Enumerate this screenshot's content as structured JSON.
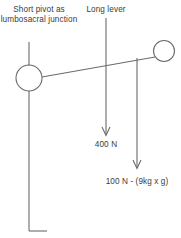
{
  "diagram": {
    "title_labels": {
      "pivot": "Short pivot as lumbosacral junction",
      "lever": "Long lever"
    },
    "forces": [
      {
        "name": "force-a",
        "label": "400 N",
        "value": 400,
        "unit": "N"
      },
      {
        "name": "force-b",
        "label": "100 N - (9kg x g)",
        "value": 100,
        "unit": "N"
      }
    ],
    "colors": {
      "stroke": "#6b6b6b",
      "text": "#3c3c3c",
      "background": "#ffffff"
    },
    "geometry": {
      "pivot_circle": {
        "cx": 29,
        "cy": 78,
        "r": 13
      },
      "load_circle": {
        "cx": 164,
        "cy": 51,
        "r": 10.5
      },
      "lever_line": {
        "x1": 42,
        "y1": 77,
        "x2": 154,
        "y2": 57
      },
      "spine_line": {
        "x": 29,
        "y1": 91,
        "y2": 231
      },
      "spine_foot": {
        "y": 231,
        "x1": 29,
        "x2": 47
      },
      "pivot_leader": {
        "x": 29,
        "y1": 42,
        "y2": 65
      },
      "lever_leader": {
        "x": 106,
        "y1": 18,
        "y2": 70
      },
      "force_a_arrow": {
        "x": 106,
        "y1": 70,
        "y2": 136
      },
      "force_b_arrow": {
        "x": 137,
        "y1": 58,
        "y2": 169
      }
    }
  }
}
